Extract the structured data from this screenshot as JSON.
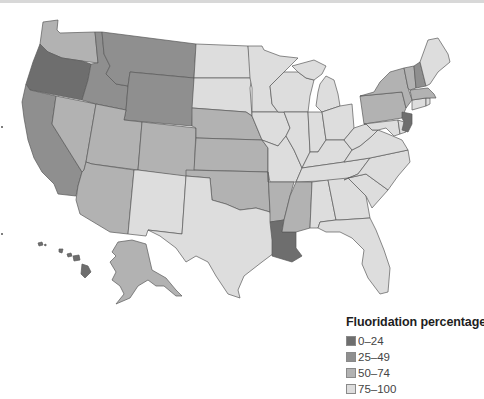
{
  "legend": {
    "title": "Fluoridation percentage",
    "items": [
      {
        "label": "0–24",
        "color": "#6e6e6e"
      },
      {
        "label": "25–49",
        "color": "#8f8f8f"
      },
      {
        "label": "50–74",
        "color": "#b2b2b2"
      },
      {
        "label": "75–100",
        "color": "#dddddd"
      }
    ]
  },
  "categories": {
    "0-24": [
      "OR",
      "LA",
      "NJ",
      "HI"
    ],
    "25-49": [
      "CA",
      "ID",
      "MT",
      "WY",
      "NH"
    ],
    "50-74": [
      "WA",
      "NV",
      "UT",
      "AZ",
      "CO",
      "NE",
      "KS",
      "OK",
      "AR",
      "MS",
      "NY",
      "PA",
      "VT",
      "MA",
      "AK"
    ],
    "75-100": [
      "ND",
      "SD",
      "MN",
      "IA",
      "MO",
      "WI",
      "IL",
      "IN",
      "MI",
      "OH",
      "KY",
      "TN",
      "AL",
      "GA",
      "FL",
      "SC",
      "NC",
      "VA",
      "WV",
      "MD",
      "DE",
      "CT",
      "RI",
      "ME",
      "TX",
      "NM"
    ]
  },
  "colors": {
    "background": "#ffffff",
    "border": "#5a5a5a"
  }
}
